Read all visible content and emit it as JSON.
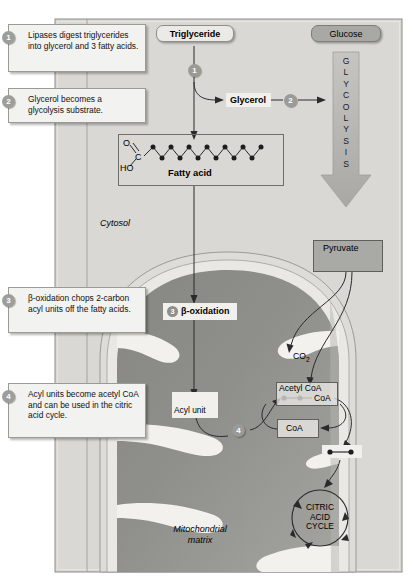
{
  "figure": {
    "title_fragment_top": "",
    "panel_bg": "#d9d8d4",
    "matrix_color": "#8f8f8b",
    "cristae_color": "#efeeea"
  },
  "callouts": [
    {
      "num": "1",
      "text": "Lipases digest triglycerides into glycerol and 3 fatty acids."
    },
    {
      "num": "2",
      "text": "Glycerol becomes a glycolysis substrate."
    },
    {
      "num": "3",
      "text": "β-oxidation chops 2-carbon acyl units off the fatty acids."
    },
    {
      "num": "4",
      "text": "Acyl units become acetyl CoA and can be used in the citric acid cycle."
    }
  ],
  "nodes": {
    "triglyceride": "Triglyceride",
    "glucose": "Glucose",
    "glycerol": "Glycerol",
    "fatty_acid": "Fatty acid",
    "fatty_acid_o": "O",
    "fatty_acid_c": "C",
    "fatty_acid_ho": "HO",
    "pyruvate": "Pyruvate",
    "beta_oxidation": "β-oxidation",
    "co2": "CO",
    "co2_sub": "2",
    "acetyl_coa": "Acetyl CoA",
    "acetyl_coa_tail": "CoA",
    "coa": "CoA",
    "acyl_unit": "Acyl unit",
    "citric_acid_cycle": "CITRIC\nACID\nCYCLE",
    "cytosol": "Cytosol",
    "mitochondrial_matrix": "Mitochondrial\nmatrix"
  },
  "glycolysis": {
    "letters": [
      "G",
      "L",
      "Y",
      "C",
      "O",
      "L",
      "Y",
      "S",
      "I",
      "S"
    ]
  },
  "step_markers": {
    "m1": "1",
    "m2": "2",
    "m3": "3",
    "m4": "4"
  }
}
